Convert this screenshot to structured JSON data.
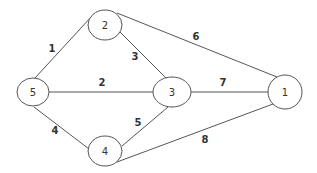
{
  "diagram": {
    "type": "weighted-undirected-graph",
    "colors": {
      "stroke": "#555555",
      "text": "#333333",
      "background": "#ffffff"
    },
    "nodes": [
      {
        "id": "1",
        "label": "1",
        "cx": 285,
        "cy": 92,
        "rx": 17,
        "ry": 17
      },
      {
        "id": "2",
        "label": "2",
        "cx": 105,
        "cy": 25,
        "rx": 17,
        "ry": 15
      },
      {
        "id": "3",
        "label": "3",
        "cx": 172,
        "cy": 92,
        "rx": 19,
        "ry": 15
      },
      {
        "id": "4",
        "label": "4",
        "cx": 105,
        "cy": 151,
        "rx": 17,
        "ry": 15
      },
      {
        "id": "5",
        "label": "5",
        "cx": 33,
        "cy": 92,
        "rx": 16,
        "ry": 14
      }
    ],
    "edges": [
      {
        "from": "5",
        "to": "2",
        "weight": "1",
        "x1": 35,
        "y1": 78,
        "x2": 92,
        "y2": 16,
        "lx": 52,
        "ly": 48
      },
      {
        "from": "5",
        "to": "3",
        "weight": "2",
        "x1": 49,
        "y1": 92,
        "x2": 153,
        "y2": 92,
        "lx": 102,
        "ly": 82
      },
      {
        "from": "2",
        "to": "3",
        "weight": "3",
        "x1": 120,
        "y1": 32,
        "x2": 166,
        "y2": 78,
        "lx": 135,
        "ly": 56
      },
      {
        "from": "5",
        "to": "4",
        "weight": "4",
        "x1": 34,
        "y1": 107,
        "x2": 89,
        "y2": 149,
        "lx": 55,
        "ly": 130
      },
      {
        "from": "4",
        "to": "3",
        "weight": "5",
        "x1": 122,
        "y1": 146,
        "x2": 168,
        "y2": 107,
        "lx": 138,
        "ly": 122
      },
      {
        "from": "2",
        "to": "1",
        "weight": "6",
        "x1": 117,
        "y1": 13,
        "x2": 277,
        "y2": 77,
        "lx": 196,
        "ly": 36
      },
      {
        "from": "3",
        "to": "1",
        "weight": "7",
        "x1": 191,
        "y1": 92,
        "x2": 268,
        "y2": 92,
        "lx": 223,
        "ly": 82
      },
      {
        "from": "4",
        "to": "1",
        "weight": "8",
        "x1": 117,
        "y1": 162,
        "x2": 273,
        "y2": 104,
        "lx": 205,
        "ly": 139
      }
    ]
  }
}
